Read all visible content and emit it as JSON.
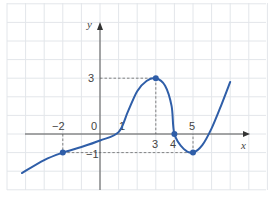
{
  "chart_data": {
    "type": "line",
    "title": "",
    "xlabel": "x",
    "ylabel": "y",
    "xlim": [
      -5,
      9
    ],
    "ylim": [
      -3,
      7
    ],
    "grid": true,
    "x_tick_labels": [
      "-2",
      "0",
      "1",
      "3",
      "4",
      "5"
    ],
    "y_tick_labels": [
      "3",
      "-1"
    ],
    "series": [
      {
        "name": "f(x)",
        "color": "#2f5ea8",
        "points": [
          {
            "x": -4.2,
            "y": -2.1
          },
          {
            "x": -3,
            "y": -1.4
          },
          {
            "x": -2,
            "y": -1.0
          },
          {
            "x": -1,
            "y": -0.7
          },
          {
            "x": 0,
            "y": -0.35
          },
          {
            "x": 1,
            "y": 0.1
          },
          {
            "x": 1.5,
            "y": 1.2
          },
          {
            "x": 2,
            "y": 2.3
          },
          {
            "x": 2.5,
            "y": 2.85
          },
          {
            "x": 3,
            "y": 3
          },
          {
            "x": 3.5,
            "y": 2.6
          },
          {
            "x": 3.85,
            "y": 1.5
          },
          {
            "x": 4,
            "y": 0
          },
          {
            "x": 4.5,
            "y": -0.8
          },
          {
            "x": 5,
            "y": -1
          },
          {
            "x": 5.5,
            "y": -0.6
          },
          {
            "x": 6,
            "y": 0.3
          },
          {
            "x": 6.5,
            "y": 1.5
          },
          {
            "x": 7,
            "y": 2.8
          }
        ]
      }
    ],
    "marked_points": [
      {
        "x": -2,
        "y": -1
      },
      {
        "x": 3,
        "y": 3
      },
      {
        "x": 4,
        "y": 0
      },
      {
        "x": 5,
        "y": -1
      }
    ],
    "guide_lines": [
      {
        "from": [
          0,
          3
        ],
        "to": [
          3,
          3
        ]
      },
      {
        "from": [
          3,
          3
        ],
        "to": [
          3,
          0
        ]
      },
      {
        "from": [
          -2,
          0
        ],
        "to": [
          -2,
          -1
        ]
      },
      {
        "from": [
          -2,
          -1
        ],
        "to": [
          5,
          -1
        ]
      },
      {
        "from": [
          5,
          -1
        ],
        "to": [
          5,
          0
        ]
      }
    ]
  }
}
